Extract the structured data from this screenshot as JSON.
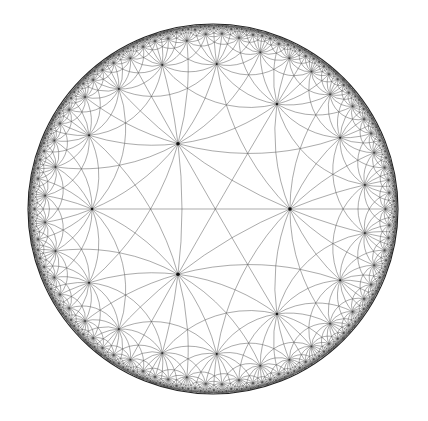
{
  "figure": {
    "model": "Poincaré disk",
    "triangle_group": {
      "p": 2,
      "q": 3,
      "r": 8
    },
    "colors": {
      "background": "#ffffff",
      "edge": "#4a4a4a",
      "vertex": "#111111",
      "rim": "#222222"
    }
  }
}
